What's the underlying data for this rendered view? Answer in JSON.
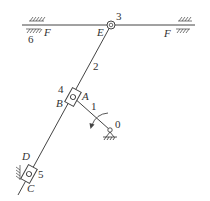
{
  "diagram": {
    "type": "mechanism-kinematic-diagram",
    "colors": {
      "line": "#444444",
      "text": "#333333",
      "background": "#ffffff"
    },
    "labels": {
      "ground_left_number": "6",
      "rail_left": "F",
      "rail_right": "F",
      "joint_E": "E",
      "joint_3": "3",
      "link_2": "2",
      "slider_4": "4",
      "point_A": "A",
      "point_B": "B",
      "link_1": "1",
      "ground_O": "0",
      "point_D": "D",
      "slider_5": "5",
      "point_C": "C"
    },
    "components": [
      {
        "id": "rail",
        "name": "horizontal guide F",
        "label": "F"
      },
      {
        "id": "pivot-3",
        "name": "revolute joint E",
        "label": "3"
      },
      {
        "id": "link-2",
        "name": "link 2 (E to C)",
        "label": "2"
      },
      {
        "id": "slider-4",
        "name": "slider 4 at A/B",
        "label": "4"
      },
      {
        "id": "crank-1",
        "name": "crank 1 (O to A)",
        "label": "1"
      },
      {
        "id": "ground-0",
        "name": "fixed pivot O",
        "label": "0"
      },
      {
        "id": "slider-5",
        "name": "slider 5 at C/D",
        "label": "5"
      },
      {
        "id": "ground-6",
        "name": "frame",
        "label": "6"
      }
    ]
  }
}
